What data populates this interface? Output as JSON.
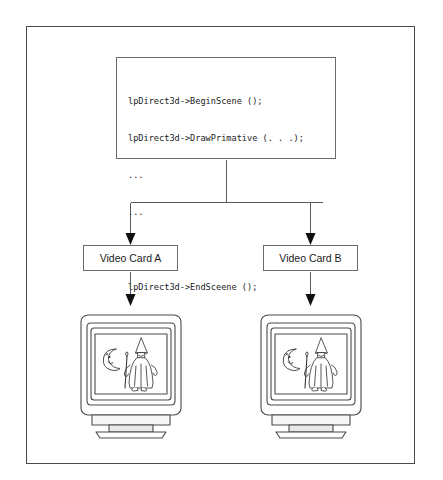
{
  "figure": {
    "type": "block-diagram"
  },
  "code_box": {
    "name": "direct3d-code-block",
    "lines": [
      "lpDirect3d->BeginScene ();",
      "lpDirect3d->DrawPrimative (. . .);",
      "...",
      "...",
      "...",
      "lpDirect3d->EndSceene ();"
    ]
  },
  "cards": [
    {
      "id": "a",
      "label": "Video Card A"
    },
    {
      "id": "b",
      "label": "Video Card B"
    }
  ],
  "monitors": [
    {
      "id": "a",
      "screen_content": "wizard-and-crescent-moon"
    },
    {
      "id": "b",
      "screen_content": "wizard-and-crescent-moon"
    }
  ],
  "side_margin_text": {
    "lines": [
      "",
      "",
      ""
    ]
  },
  "colors": {
    "frame_border": "#4a4a4a",
    "box_border": "#6b6b6b",
    "line": "#5a5a5a",
    "arrow_fill": "#111111",
    "text": "#1b1b1b",
    "background": "#ffffff"
  }
}
